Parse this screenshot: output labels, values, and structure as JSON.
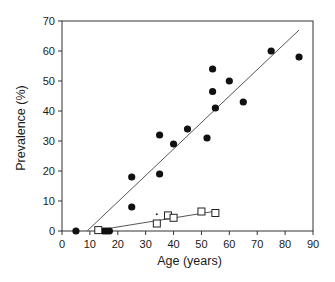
{
  "chart_data": {
    "type": "scatter",
    "title": "",
    "xlabel": "Age (years)",
    "ylabel": "Prevalence (%)",
    "xlim": [
      0,
      90
    ],
    "ylim": [
      0,
      70
    ],
    "xticks": [
      0,
      10,
      20,
      30,
      40,
      50,
      60,
      70,
      80,
      90
    ],
    "yticks": [
      0,
      10,
      20,
      30,
      40,
      50,
      60,
      70
    ],
    "grid": false,
    "legend": null,
    "series": [
      {
        "name": "filled-circles",
        "marker": "filled-circle",
        "points": [
          [
            5,
            0
          ],
          [
            15,
            0
          ],
          [
            16,
            0
          ],
          [
            17,
            0
          ],
          [
            25,
            18
          ],
          [
            25,
            8
          ],
          [
            35,
            32
          ],
          [
            35,
            19
          ],
          [
            40,
            29
          ],
          [
            45,
            34
          ],
          [
            52,
            31
          ],
          [
            54,
            54
          ],
          [
            54,
            46.5
          ],
          [
            55,
            41
          ],
          [
            60,
            50
          ],
          [
            65,
            43
          ],
          [
            75,
            60
          ],
          [
            85,
            58
          ]
        ],
        "fit_line": [
          [
            9,
            0
          ],
          [
            85,
            67
          ]
        ]
      },
      {
        "name": "open-squares",
        "marker": "open-square",
        "points": [
          [
            13,
            0.3
          ],
          [
            34,
            2.5
          ],
          [
            38,
            5.2
          ],
          [
            40,
            4.4
          ],
          [
            50,
            6.5
          ],
          [
            55,
            6
          ]
        ],
        "fit_line": [
          [
            13,
            0.3
          ],
          [
            55,
            6.6
          ]
        ]
      }
    ],
    "annotations": [
      {
        "type": "dot",
        "x": 34,
        "y": 5.6
      }
    ]
  },
  "plot": {
    "left": 62,
    "right": 313,
    "top": 21,
    "bottom": 231
  }
}
